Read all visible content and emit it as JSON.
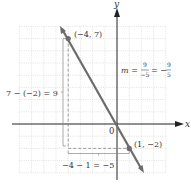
{
  "graph": {
    "axes": {
      "x_label": "x",
      "y_label": "y",
      "origin_label": "0"
    },
    "points": [
      {
        "label": "(−4, 7)",
        "x": -4,
        "y": 7
      },
      {
        "label": "(1, −2)",
        "x": 1,
        "y": -2
      }
    ],
    "annotations": {
      "rise": "7 − (−2) = 9",
      "run": "−4 − 1 = −5",
      "slope_prefix": "m =",
      "slope_num1": "9",
      "slope_den1": "−5",
      "slope_eq": "= −",
      "slope_num2": "9",
      "slope_den2": "5"
    },
    "grid": {
      "xmin": -8,
      "xmax": 4,
      "ymin": -4,
      "ymax": 8
    },
    "colors": {
      "line": "#6b6b6b",
      "grid": "#c8c8c8",
      "axis": "#222222",
      "dashed": "#888888"
    }
  }
}
